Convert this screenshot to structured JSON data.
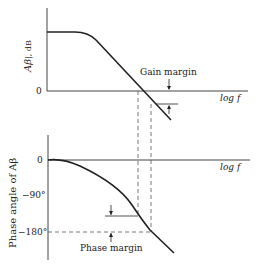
{
  "gain_plot": {
    "ylabel": "|Aβ|, dB",
    "ylabel_main": "Aβ",
    "ylabel_unit": "|, dB",
    "zero_tick": "0",
    "xlabel": "log f",
    "annotation": "Gain margin"
  },
  "phase_plot": {
    "ylabel": "Phase angle of Aβ",
    "ticks": [
      "0",
      "−90°",
      "−180°"
    ],
    "xlabel": "log f",
    "annotation": "Phase margin"
  },
  "colors": {
    "line": "#222222",
    "axis": "#444444",
    "dashed": "#555555",
    "background": "#ffffff"
  }
}
